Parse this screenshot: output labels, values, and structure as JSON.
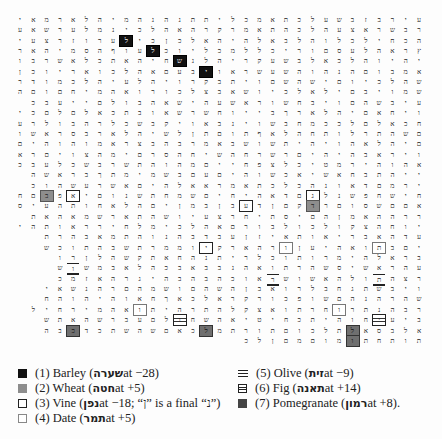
{
  "grid": {
    "columns": 31,
    "rows": [
      "עירבזבשעלכתאמכליתתנהנהמיהלארמאיו",
      "רבשראצעהלכהתאמרקרהאהלכינמלערשאעיו",
      "הכחילכלוהלבאלהיהאלכןכילערוזרצעירם",
      "ץראהלעסםוריכללמכליוכלעוףהסמיהאריצ",
      "יהיוהלכאלבשעקריהלנשחיהאתכלאשרבונה",
      "אמבוםהנהוהשעשראויבעםאהלכואריוכן",
      "שהלכיוםישהשםויתבקרויהלעיהלכמודר",
      "שמויבםילאלכיושאבצלכורואהמיחםוםה",
      "עיבשהםויבחשוראשעהישאהבולםייעבכ",
      "ויחאםיהלארךבייוחשרשאובתכאלםלםכי",
      "חכאלםלככמחבשוינבאויקבשכלרהבולרע",
      "םשהתרלותחהלאףתוםתןלשיהלארבסראשו",
      "םיהלאהויהיתשושבאמרבהבצראמוהוהים",
      "ויראבהיהיםרשרחהשיחהסרםימהצויםרא",
      "אהוהירמטיכלצפחייםמהוהתשרבשכלעבכ",
      "ייהתבחאשיאכשוהיםעםבשמימתךבראשה",
      "ירמםדאונהכלכתאמראאלהיםאשרעשהוכ",
      "חישחפשנלגםדאהיחיםשמחתשנוםיאפבםח",
      "אםםשסוםרדקםןדעבןבמןיםהלאחותהעיסי",
      "ררההאמןהםיסתיחרצעיושהתארשמאהאת",
      "יוחהצקולכולבורםאהלכימלחירראותהיט",
      "עדהאבריאותאיזןעבדבהנוהתמאבהרת",
      "יםבתואהיעןורהארקיוממרתשבהתוכש",
      "בראלהימרותוכלריתנהחאתקשהלןרו",
      "עהראשיסשהרתואהנבבאבכהלאבמשוש",
      "רצהתולהאשושראוכהבהבהיגרהאזמכ",
      "ויבשתגחבלרואבןהשהםושמהםרהנשאי",
      "שהרהנהםשופכורקראלכאךחאוהיהוהח",
      "רבהנתרוחרתואצקלהתרהיתואהמירחיל",
      "ביעיחוהיתכחיטיאהשחולםעברשהאתש",
      "אלבסאלתלכוםתורתמלכאםשהשתכדכבה"
    ],
    "last_row": "תותחתומוםמםןלכ",
    "highlights": [
      {
        "row": 2,
        "col": 8,
        "type": "barley"
      },
      {
        "row": 3,
        "col": 10,
        "type": "barley"
      },
      {
        "row": 4,
        "col": 12,
        "type": "barley"
      },
      {
        "row": 5,
        "col": 14,
        "type": "barley"
      },
      {
        "row": 17,
        "col": 2,
        "type": "wheat"
      },
      {
        "row": 18,
        "col": 22,
        "type": "wheat"
      },
      {
        "row": 17,
        "col": 4,
        "type": "vine"
      },
      {
        "row": 17,
        "col": 22,
        "type": "vine"
      },
      {
        "row": 18,
        "col": 17,
        "type": "vine"
      },
      {
        "row": 20,
        "col": 40,
        "type": "date"
      },
      {
        "row": 22,
        "col": 14,
        "type": "vine"
      },
      {
        "row": 22,
        "col": 20,
        "type": "date"
      },
      {
        "row": 22,
        "col": 27,
        "type": "date"
      },
      {
        "row": 24,
        "col": 4,
        "type": "olive"
      },
      {
        "row": 25,
        "col": 19,
        "type": "olive"
      },
      {
        "row": 25,
        "col": 27,
        "type": "olive"
      },
      {
        "row": 28,
        "col": 9,
        "type": "date"
      },
      {
        "row": 28,
        "col": 24,
        "type": "date"
      },
      {
        "row": 29,
        "col": 12,
        "type": "fig"
      },
      {
        "row": 29,
        "col": 27,
        "type": "fig"
      },
      {
        "row": 30,
        "col": 4,
        "type": "pomegranate"
      },
      {
        "row": 30,
        "col": 14,
        "type": "pomegranate"
      },
      {
        "row": 30,
        "col": 25,
        "type": "pomegranate"
      },
      {
        "row": 31,
        "col": 25,
        "type": "pomegranate"
      }
    ]
  },
  "legend": {
    "left": [
      {
        "swatch": "barley",
        "label": "(1) Barley (",
        "hebrew": "שערה",
        "tail": " at −28)"
      },
      {
        "swatch": "wheat",
        "label": "(2) Wheat (",
        "hebrew": "חטה",
        "tail": " at +5)"
      },
      {
        "swatch": "vine",
        "label": "(3) Vine (",
        "hebrew": "נפן",
        "tail": " at −18; “ן” is a final “נ”)"
      },
      {
        "swatch": "date",
        "label": "(4) Date (",
        "hebrew": "תמר",
        "tail": " at +5)"
      }
    ],
    "right": [
      {
        "swatch": "olive",
        "label": "(5) Olive (",
        "hebrew": "זית",
        "tail": " at −9)"
      },
      {
        "swatch": "fig",
        "label": "(6) Fig (",
        "hebrew": "תאנה",
        "tail": " at +14)"
      },
      {
        "swatch": "pomegranate",
        "label": "(7) Pomegranate (",
        "hebrew": "רמון",
        "tail": " at +8)."
      }
    ]
  }
}
